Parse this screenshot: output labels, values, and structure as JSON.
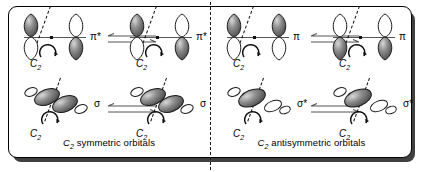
{
  "figure": {
    "type": "orbital-symmetry-diagram",
    "panels": [
      {
        "id": "left",
        "caption_prefix": "C",
        "caption_sub": "2",
        "caption_text": "symmetric  orbitals",
        "caption_full": "C2 symmetric orbitals",
        "rows": [
          {
            "id": "pi-star-row",
            "orbital_label": "π*",
            "orbital_kind": "pi-antibonding",
            "left_diagram": {
              "axis_label": "C",
              "axis_sub": "2",
              "rotation_symbol": "curved-arrow",
              "lobes": [
                {
                  "position": "left-top",
                  "shade": "dark"
                },
                {
                  "position": "left-bottom",
                  "shade": "light"
                },
                {
                  "position": "right-top",
                  "shade": "light"
                },
                {
                  "position": "right-bottom",
                  "shade": "dark"
                }
              ]
            },
            "right_diagram": {
              "axis_label": "C",
              "axis_sub": "2",
              "rotation_symbol": "curved-arrow",
              "lobes": [
                {
                  "position": "left-top",
                  "shade": "dark"
                },
                {
                  "position": "left-bottom",
                  "shade": "light"
                },
                {
                  "position": "right-top",
                  "shade": "light"
                },
                {
                  "position": "right-bottom",
                  "shade": "dark"
                }
              ]
            },
            "arrow": "equilibrium-double-arrow"
          },
          {
            "id": "sigma-row",
            "orbital_label": "σ",
            "orbital_kind": "sigma-bonding",
            "left_diagram": {
              "axis_label": "C",
              "axis_sub": "2",
              "rotation_symbol": "curved-arrow",
              "lobes": [
                {
                  "position": "outer-left",
                  "shade": "light"
                },
                {
                  "position": "inner-left",
                  "shade": "dark"
                },
                {
                  "position": "inner-right",
                  "shade": "dark"
                },
                {
                  "position": "outer-right",
                  "shade": "light"
                }
              ]
            },
            "right_diagram": {
              "axis_label": "C",
              "axis_sub": "2",
              "rotation_symbol": "curved-arrow",
              "lobes": [
                {
                  "position": "outer-left",
                  "shade": "light"
                },
                {
                  "position": "inner-left",
                  "shade": "dark"
                },
                {
                  "position": "inner-right",
                  "shade": "dark"
                },
                {
                  "position": "outer-right",
                  "shade": "light"
                }
              ]
            },
            "arrow": "equilibrium-double-arrow"
          }
        ]
      },
      {
        "id": "right",
        "caption_prefix": "C",
        "caption_sub": "2",
        "caption_text": "antisymmetric  orbitals",
        "caption_full": "C2 antisymmetric orbitals",
        "rows": [
          {
            "id": "pi-row",
            "orbital_label": "π",
            "orbital_kind": "pi-bonding",
            "left_diagram": {
              "axis_label": "C",
              "axis_sub": "2",
              "rotation_symbol": "curved-arrow",
              "lobes": [
                {
                  "position": "left-top",
                  "shade": "dark"
                },
                {
                  "position": "left-bottom",
                  "shade": "light"
                },
                {
                  "position": "right-top",
                  "shade": "dark"
                },
                {
                  "position": "right-bottom",
                  "shade": "light"
                }
              ]
            },
            "right_diagram": {
              "axis_label": "C",
              "axis_sub": "2",
              "rotation_symbol": "curved-arrow",
              "lobes": [
                {
                  "position": "left-top",
                  "shade": "light"
                },
                {
                  "position": "left-bottom",
                  "shade": "dark"
                },
                {
                  "position": "right-top",
                  "shade": "light"
                },
                {
                  "position": "right-bottom",
                  "shade": "dark"
                }
              ]
            },
            "arrow": "equilibrium-double-arrow"
          },
          {
            "id": "sigma-star-row",
            "orbital_label": "σ*",
            "orbital_kind": "sigma-antibonding",
            "left_diagram": {
              "axis_label": "C",
              "axis_sub": "2",
              "rotation_symbol": "curved-arrow",
              "lobes": [
                {
                  "position": "outer-left",
                  "shade": "light"
                },
                {
                  "position": "inner-left",
                  "shade": "dark"
                },
                {
                  "position": "inner-right",
                  "shade": "light"
                },
                {
                  "position": "outer-right",
                  "shade": "light"
                }
              ]
            },
            "right_diagram": {
              "axis_label": "C",
              "axis_sub": "2",
              "rotation_symbol": "curved-arrow",
              "lobes": [
                {
                  "position": "outer-left",
                  "shade": "light"
                },
                {
                  "position": "inner-left",
                  "shade": "dark"
                },
                {
                  "position": "inner-right",
                  "shade": "light"
                },
                {
                  "position": "outer-right",
                  "shade": "light"
                }
              ]
            },
            "arrow": "equilibrium-double-arrow"
          }
        ]
      }
    ],
    "colors": {
      "ink": "#000000",
      "lobe_dark": "#6e6e6e",
      "lobe_light": "#ffffff",
      "bond_line": "#555555",
      "divider": "#1a1a1a"
    }
  }
}
